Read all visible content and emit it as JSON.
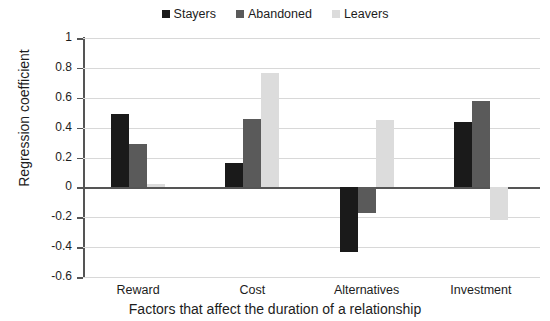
{
  "chart_data": {
    "type": "bar",
    "title": "",
    "categories": [
      "Reward",
      "Cost",
      "Alternatives",
      "Investment"
    ],
    "series": [
      {
        "name": "Stayers",
        "color": "#1a1a1a",
        "values": [
          0.49,
          0.16,
          -0.43,
          0.44
        ]
      },
      {
        "name": "Abandoned",
        "color": "#5a5a5a",
        "values": [
          0.29,
          0.455,
          -0.17,
          0.58
        ]
      },
      {
        "name": "Leavers",
        "color": "#dcdcdc",
        "values": [
          0.02,
          0.765,
          0.45,
          -0.22
        ]
      }
    ],
    "xlabel": "Factors that affect the duration of a relationship",
    "ylabel": "Regression coefficient",
    "ylim": [
      -0.6,
      1
    ],
    "ytick_values": [
      1,
      0.8,
      0.6,
      0.4,
      0.2,
      0,
      -0.2,
      -0.4,
      -0.6
    ],
    "ytick_labels": [
      "1",
      "0.8",
      "0.6",
      "0.4",
      "0.2",
      "0",
      "-0.2",
      "-0.4",
      "-0.6"
    ],
    "grid": true,
    "legend_position": "top-center",
    "grid_color": "#d8d8d8",
    "axis_color": "#555555"
  }
}
